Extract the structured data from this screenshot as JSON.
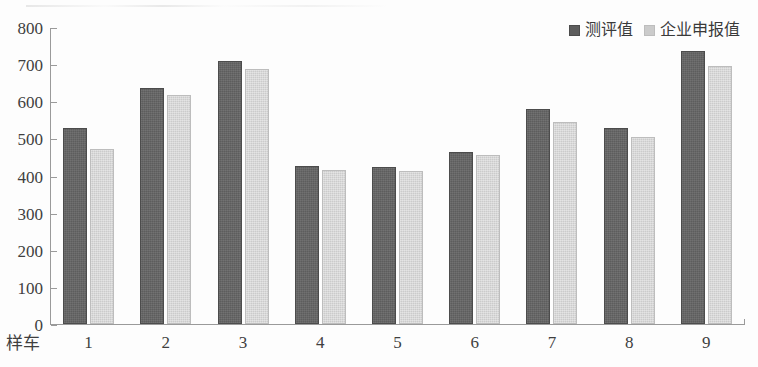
{
  "chart_data": {
    "type": "bar",
    "title": "",
    "subtitle": "",
    "xlabel": "样车",
    "ylabel": "",
    "categories": [
      "1",
      "2",
      "3",
      "4",
      "5",
      "6",
      "7",
      "8",
      "9"
    ],
    "series": [
      {
        "name": "测评值",
        "color": "#5d5d5d",
        "values": [
          522,
          630,
          703,
          420,
          417,
          458,
          574,
          522,
          730
        ]
      },
      {
        "name": "企业申报值",
        "color": "#cbcbcb",
        "values": [
          466,
          611,
          682,
          409,
          407,
          450,
          539,
          498,
          690
        ]
      }
    ],
    "ylim": [
      0,
      800
    ],
    "ytick_step": 100,
    "yticks": [
      "800",
      "700",
      "600",
      "500",
      "400",
      "300",
      "200",
      "100",
      "0"
    ],
    "grid": false,
    "legend_position": "top-right"
  },
  "legend": {
    "items": [
      {
        "label": "测评值",
        "swatch": "measured"
      },
      {
        "label": "企业申报值",
        "swatch": "declared"
      }
    ]
  }
}
